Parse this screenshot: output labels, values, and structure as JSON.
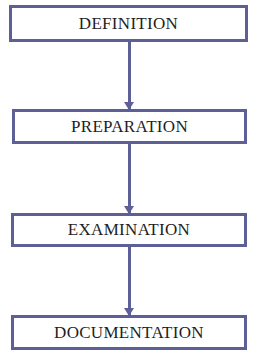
{
  "diagram": {
    "type": "vertical-flowchart",
    "colors": {
      "border": "#5d6096",
      "arrow": "#5d6096",
      "text": "#1e1e1e",
      "background": "#ffffff"
    },
    "steps": [
      {
        "label": "DEFINITION"
      },
      {
        "label": "PREPARATION"
      },
      {
        "label": "EXAMINATION"
      },
      {
        "label": "DOCUMENTATION"
      }
    ],
    "edges": [
      {
        "from": "DEFINITION",
        "to": "PREPARATION"
      },
      {
        "from": "PREPARATION",
        "to": "EXAMINATION"
      },
      {
        "from": "EXAMINATION",
        "to": "DOCUMENTATION"
      }
    ]
  }
}
